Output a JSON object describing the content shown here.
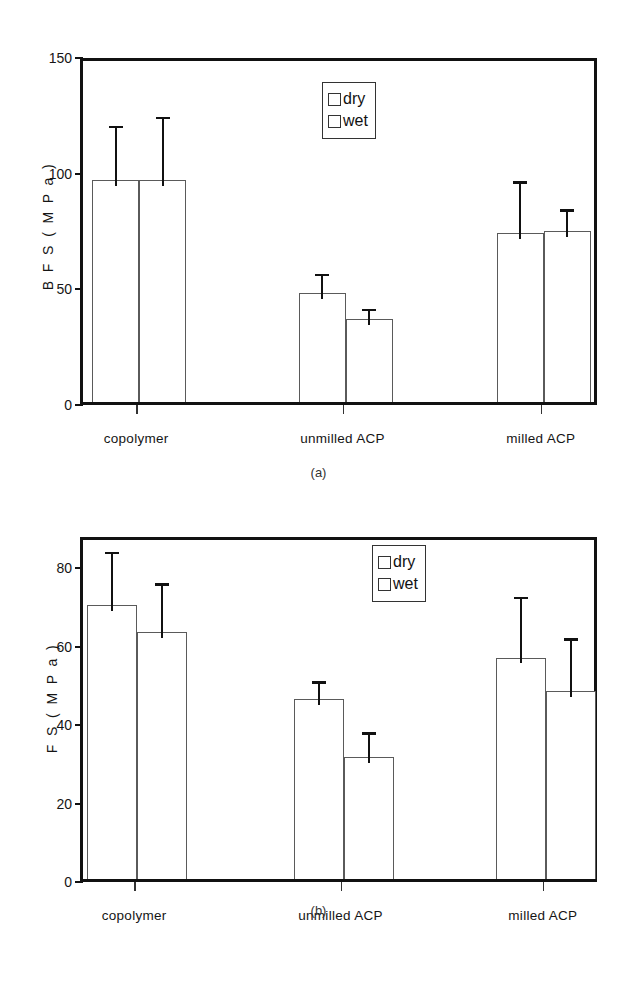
{
  "figure": {
    "legend": {
      "entries": [
        "dry",
        "wet"
      ],
      "swatch_style": "open-square"
    }
  },
  "chart_data": [
    {
      "panel": "a",
      "caption": "(a)",
      "type": "bar",
      "title": "",
      "xlabel": "",
      "ylabel": "B F S  ( M P a )",
      "categories": [
        "copolymer",
        "unmilled ACP",
        "milled ACP"
      ],
      "yticks": [
        0,
        50,
        100,
        150
      ],
      "ylim": [
        0,
        150
      ],
      "grid": false,
      "legend_position": "upper-center",
      "series": [
        {
          "name": "dry",
          "values": [
            96,
            47,
            73
          ],
          "errors": [
            26,
            11,
            25
          ]
        },
        {
          "name": "wet",
          "values": [
            96,
            36,
            74
          ],
          "errors": [
            30,
            7,
            12
          ]
        }
      ]
    },
    {
      "panel": "b",
      "caption": "(b)",
      "type": "bar",
      "title": "",
      "xlabel": "",
      "ylabel": "F S  ( M P a )",
      "categories": [
        "copolymer",
        "unmilled ACP",
        "milled ACP"
      ],
      "yticks": [
        0,
        20,
        40,
        60,
        80
      ],
      "ylim": [
        0,
        88
      ],
      "grid": false,
      "legend_position": "upper-center",
      "series": [
        {
          "name": "dry",
          "values": [
            70,
            46,
            56.5
          ],
          "errors": [
            15,
            6,
            17
          ]
        },
        {
          "name": "wet",
          "values": [
            63,
            31,
            48
          ],
          "errors": [
            14,
            8,
            15
          ]
        }
      ]
    }
  ]
}
